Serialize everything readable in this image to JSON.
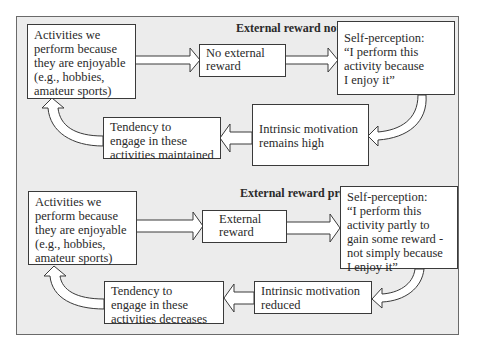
{
  "diagram": {
    "colors": {
      "background": "#ececec",
      "box": "#ffffff",
      "border": "#3a3a3a",
      "frame_border": "#6a6a6a"
    },
    "panels": [
      {
        "title": "External reward not present",
        "activities": "Activities we\nperform because\nthey are enjoyable\n(e.g., hobbies,\namateur sports)",
        "reward": "No external\nreward",
        "self_perception": "Self-perception:\n“I perform this\nactivity because\nI enjoy it”",
        "intrinsic": "Intrinsic motivation\nremains high",
        "tendency": "Tendency to\nengage in these\nactivities maintained"
      },
      {
        "title": "External reward present",
        "activities": "Activities we\nperform because\nthey are enjoyable\n(e.g., hobbies,\namateur sports)",
        "reward": "External\nreward",
        "self_perception": "Self-perception:\n“I perform this\nactivity partly to\ngain some reward -\nnot simply because\nI enjoy it”",
        "intrinsic": "Intrinsic motivation\nreduced",
        "tendency": "Tendency to\nengage in these\nactivities decreases"
      }
    ]
  }
}
